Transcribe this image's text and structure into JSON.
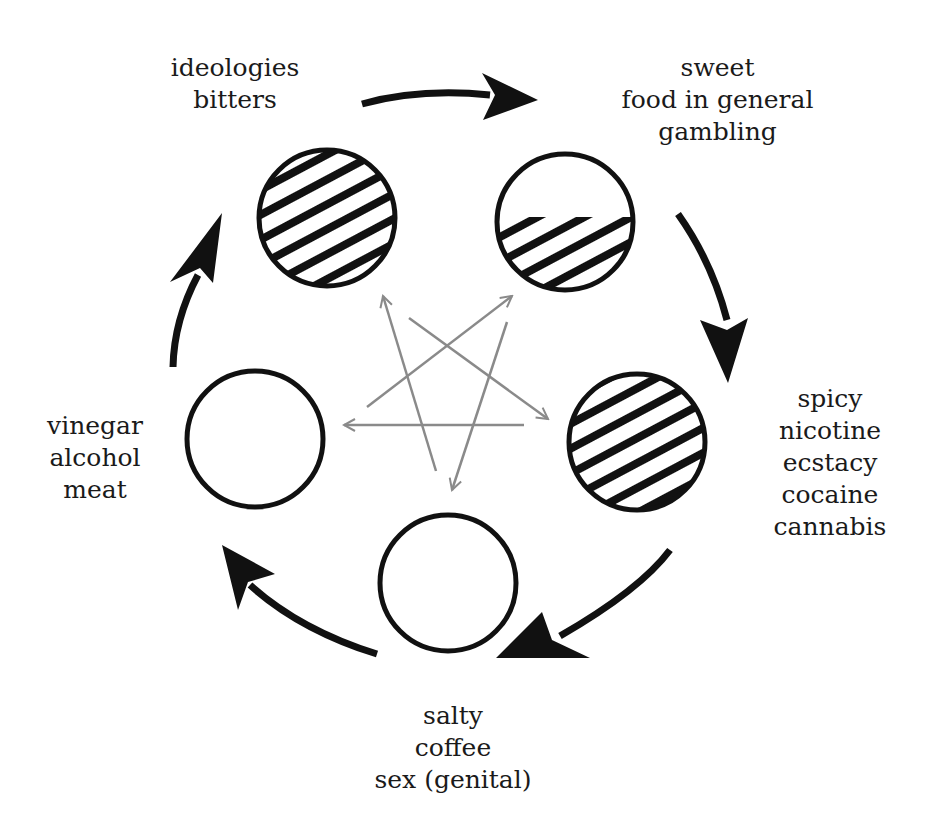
{
  "diagram": {
    "title": "",
    "nodes": [
      {
        "id": "top-left",
        "fill": "full-hatch",
        "labels": [
          "ideologies",
          "bitters"
        ]
      },
      {
        "id": "top-right",
        "fill": "half-hatch",
        "labels": [
          "sweet",
          "food in general",
          "gambling"
        ]
      },
      {
        "id": "right",
        "fill": "full-hatch",
        "labels": [
          "spicy",
          "nicotine",
          "ecstacy",
          "cocaine",
          "cannabis"
        ]
      },
      {
        "id": "bottom",
        "fill": "empty",
        "labels": [
          "salty",
          "coffee",
          "sex (genital)"
        ]
      },
      {
        "id": "left",
        "fill": "empty",
        "labels": [
          "vinegar",
          "alcohol",
          "meat"
        ]
      }
    ],
    "outer_cycle": [
      "top-left",
      "top-right",
      "right",
      "bottom",
      "left",
      "top-left"
    ],
    "inner_star_arrows": [
      {
        "from": "left",
        "to": "top-right"
      },
      {
        "from": "top-left",
        "to": "right"
      },
      {
        "from": "right",
        "to": "left"
      },
      {
        "from": "top-right",
        "to": "bottom"
      },
      {
        "from": "bottom",
        "to": "top-left"
      }
    ],
    "colors": {
      "ink": "#111111",
      "star_arrows": "#8a8a8a",
      "background": "#ffffff"
    }
  }
}
